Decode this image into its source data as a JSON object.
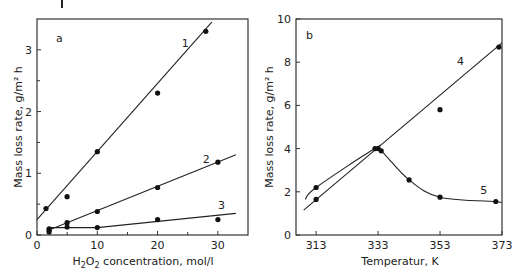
{
  "chart_data": [
    {
      "type": "scatter",
      "panel": "a",
      "title": "",
      "xlabel": "H2O2 concentration, mol/l",
      "xlabel_main": "H",
      "xlabel_sub1": "2",
      "xlabel_mid": "O",
      "xlabel_sub2": "2",
      "xlabel_rest": " concentration, mol/l",
      "ylabel": "Mass loss rate, g/m² h",
      "xlim": [
        0,
        35
      ],
      "ylim": [
        0,
        3.5
      ],
      "xticks": [
        0,
        10,
        20,
        30
      ],
      "xtick_labels": [
        "0",
        "10",
        "20",
        "30"
      ],
      "yticks": [
        0,
        1,
        2,
        3
      ],
      "ytick_labels": [
        "0",
        "1",
        "2",
        "3"
      ],
      "grid": false,
      "series": [
        {
          "name": "1",
          "x": [
            1.5,
            5,
            10,
            20,
            28
          ],
          "y": [
            0.43,
            0.62,
            1.35,
            2.3,
            3.3
          ],
          "fit_line": [
            [
              0,
              0.25
            ],
            [
              29,
              3.45
            ]
          ],
          "label_pos": [
            24,
            3.05
          ]
        },
        {
          "name": "2",
          "x": [
            2,
            5,
            10,
            20,
            30
          ],
          "y": [
            0.1,
            0.2,
            0.38,
            0.77,
            1.18
          ],
          "fit_line": [
            [
              2,
              0.08
            ],
            [
              33,
              1.3
            ]
          ],
          "label_pos": [
            27.5,
            1.17
          ]
        },
        {
          "name": "3",
          "x": [
            2,
            2,
            5,
            10,
            20,
            30
          ],
          "y": [
            0.05,
            0.08,
            0.13,
            0.12,
            0.25,
            0.25
          ],
          "fit_line": [
            [
              2,
              0.12
            ],
            [
              10,
              0.12
            ],
            [
              33,
              0.35
            ]
          ],
          "label_pos": [
            30,
            0.42
          ]
        }
      ]
    },
    {
      "type": "line",
      "panel": "b",
      "title": "",
      "xlabel": "Temperatur, K",
      "ylabel": "Mass loss rate, g/m² h",
      "xlim": [
        306.5,
        373
      ],
      "ylim": [
        0,
        10
      ],
      "xticks": [
        313,
        333,
        353,
        373
      ],
      "xtick_labels": [
        "313",
        "333",
        "353",
        "373"
      ],
      "yticks": [
        0,
        2,
        4,
        6,
        8,
        10
      ],
      "ytick_labels": [
        "0",
        "2",
        "4",
        "6",
        "8",
        "10"
      ],
      "grid": false,
      "series": [
        {
          "name": "4",
          "x": [
            313,
            333,
            353,
            372
          ],
          "y": [
            1.65,
            4.0,
            5.8,
            8.7
          ],
          "fit_line": [
            [
              309,
              1.15
            ],
            [
              373,
              8.9
            ]
          ],
          "label_pos": [
            358.5,
            7.85
          ]
        },
        {
          "name": "5",
          "x": [
            313,
            332,
            334,
            343,
            353,
            371
          ],
          "y": [
            2.2,
            4.0,
            3.9,
            2.55,
            1.75,
            1.55
          ],
          "curve": "smooth",
          "label_pos": [
            366,
            1.9
          ]
        }
      ]
    }
  ]
}
